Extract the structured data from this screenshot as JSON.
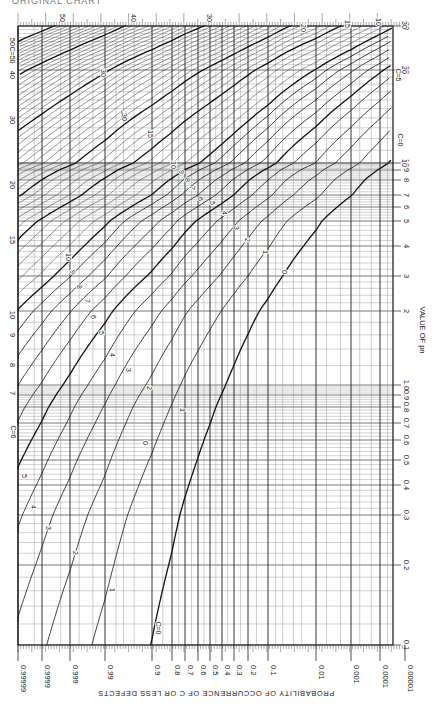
{
  "header": {
    "title_fragment": "ORIGINAL CHART"
  },
  "chart_data": {
    "type": "line",
    "xlabel": "PROBABILITY OF OCCURRENCE OF C OR LESS DEFECTS",
    "ylabel": "VALUE OF pn",
    "x_scale": "probability (normal-probability-like)",
    "y_scale": "log",
    "orientation": "rotated 90 degrees; probability axis along bottom, pn axis along right side",
    "probability_ticks": [
      "0.99999",
      "0.9999",
      "0.999",
      "0.99",
      "0.9",
      "0.8",
      "0.7",
      "0.6",
      "0.5",
      "0.4",
      "0.3",
      "0.2",
      "0.1",
      "0.01",
      "0.001",
      "0.0001",
      "0.00001"
    ],
    "probability_tick_px": [
      18,
      42,
      70,
      105,
      152,
      172,
      185,
      198,
      210,
      222,
      234,
      248,
      268,
      316,
      351,
      380,
      405
    ],
    "pn_ticks_right": [
      "0.1",
      "0.2",
      "0.3",
      "0.4",
      "0.5",
      "0.6",
      "0.7",
      "0.8",
      "0.9",
      "1.0",
      "2",
      "3",
      "4",
      "5",
      "6",
      "7",
      "8",
      "9",
      "10",
      "20",
      "30"
    ],
    "pn_tick_values": [
      0.1,
      0.2,
      0.3,
      0.4,
      0.5,
      0.6,
      0.7,
      0.8,
      0.9,
      1.0,
      2,
      3,
      4,
      5,
      6,
      7,
      8,
      9,
      10,
      20,
      30
    ],
    "pn_tick_px": [
      645,
      565,
      515,
      485,
      460,
      440,
      423,
      407,
      395,
      385,
      311,
      276,
      246,
      221,
      207,
      195,
      180,
      170,
      163,
      70,
      26
    ],
    "pn_ticks_left": [
      "7",
      "8",
      "9",
      "10",
      "15",
      "20",
      "30",
      "40",
      "50"
    ],
    "top_curve_labels": [
      "50",
      "40",
      "30",
      "20",
      "15",
      "10"
    ],
    "curve_markers": [
      "C=0",
      "C=5",
      "C=6",
      "C=50"
    ],
    "series": [
      {
        "name": "C=0",
        "c": 0
      },
      {
        "name": "1",
        "c": 1
      },
      {
        "name": "2",
        "c": 2
      },
      {
        "name": "3",
        "c": 3
      },
      {
        "name": "4",
        "c": 4
      },
      {
        "name": "5",
        "c": 5
      },
      {
        "name": "6",
        "c": 6
      },
      {
        "name": "7",
        "c": 7
      },
      {
        "name": "8",
        "c": 8
      },
      {
        "name": "9",
        "c": 9
      },
      {
        "name": "10",
        "c": 10
      },
      {
        "name": "15",
        "c": 15
      },
      {
        "name": "20",
        "c": 20
      },
      {
        "name": "30",
        "c": 30
      },
      {
        "name": "40",
        "c": 40
      },
      {
        "name": "50",
        "c": 50
      }
    ],
    "example_points": [
      {
        "c": 0,
        "pn": 1.0,
        "prob": 0.368
      },
      {
        "c": 0,
        "pn": 2.3,
        "prob": 0.1
      },
      {
        "c": 1,
        "pn": 1.0,
        "prob": 0.736
      },
      {
        "c": 2,
        "pn": 2.0,
        "prob": 0.677
      },
      {
        "c": 5,
        "pn": 5.0,
        "prob": 0.616
      },
      {
        "c": 10,
        "pn": 10.0,
        "prob": 0.583
      }
    ],
    "grid": true,
    "legend": "inline curve labels"
  }
}
